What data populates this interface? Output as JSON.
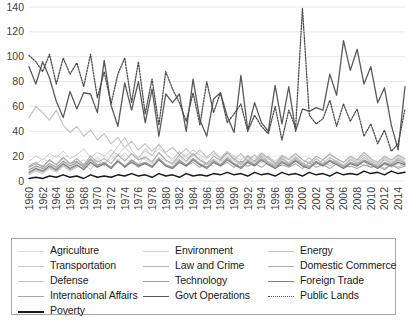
{
  "chart_data": {
    "type": "line",
    "title": "",
    "subtitle": "",
    "xlabel": "",
    "ylabel": "",
    "xlim": [
      1960,
      2015
    ],
    "ylim": [
      0,
      140
    ],
    "grid": true,
    "grid_axis": "y",
    "legend_position": "bottom",
    "y_ticks": [
      0,
      20,
      40,
      60,
      80,
      100,
      120,
      140
    ],
    "x_ticks": [
      "1960",
      "1962",
      "1964",
      "1966",
      "1968",
      "1970",
      "1972",
      "1974",
      "1976",
      "1978",
      "1980",
      "1982",
      "1984",
      "1986",
      "1988",
      "1990",
      "1992",
      "1994",
      "1996",
      "1998",
      "2000",
      "2002",
      "2004",
      "2006",
      "2008",
      "2010",
      "2012",
      "2014"
    ],
    "x": [
      1960,
      1961,
      1962,
      1963,
      1964,
      1965,
      1966,
      1967,
      1968,
      1969,
      1970,
      1971,
      1972,
      1973,
      1974,
      1975,
      1976,
      1977,
      1978,
      1979,
      1980,
      1981,
      1982,
      1983,
      1984,
      1985,
      1986,
      1987,
      1988,
      1989,
      1990,
      1991,
      1992,
      1993,
      1994,
      1995,
      1996,
      1997,
      1998,
      1999,
      2000,
      2001,
      2002,
      2003,
      2004,
      2005,
      2006,
      2007,
      2008,
      2009,
      2010,
      2011,
      2012,
      2013,
      2014,
      2015
    ],
    "series": [
      {
        "name": "Agriculture",
        "color": "#d9d9d9",
        "dash": "solid",
        "width": 1,
        "values": [
          14,
          13,
          18,
          15,
          21,
          17,
          13,
          16,
          12,
          15,
          19,
          14,
          17,
          22,
          18,
          15,
          20,
          17,
          14,
          19,
          16,
          13,
          18,
          21,
          15,
          19,
          14,
          12,
          17,
          15,
          20,
          14,
          11,
          16,
          13,
          18,
          15,
          12,
          14,
          16,
          13,
          11,
          15,
          12,
          14,
          17,
          13,
          11,
          15,
          12,
          14,
          10,
          13,
          11,
          14,
          12
        ]
      },
      {
        "name": "Transportation",
        "color": "#cccccc",
        "dash": "solid",
        "width": 1,
        "values": [
          16,
          20,
          17,
          22,
          19,
          24,
          18,
          21,
          26,
          19,
          23,
          20,
          25,
          21,
          27,
          22,
          19,
          24,
          21,
          26,
          22,
          18,
          23,
          20,
          25,
          21,
          18,
          22,
          19,
          24,
          20,
          17,
          21,
          18,
          23,
          19,
          16,
          21,
          18,
          22,
          17,
          15,
          20,
          17,
          21,
          18,
          15,
          19,
          16,
          21,
          17,
          14,
          19,
          16,
          20,
          17
        ]
      },
      {
        "name": "Defense",
        "color": "#bfbfbf",
        "dash": "solid",
        "width": 1.1,
        "values": [
          51,
          60,
          55,
          49,
          57,
          45,
          39,
          44,
          36,
          41,
          33,
          38,
          30,
          35,
          27,
          32,
          25,
          30,
          24,
          29,
          23,
          27,
          21,
          26,
          20,
          25,
          19,
          24,
          18,
          23,
          17,
          22,
          16,
          21,
          15,
          20,
          14,
          19,
          13,
          18,
          14,
          19,
          13,
          17,
          12,
          16,
          11,
          15,
          12,
          16,
          11,
          14,
          10,
          13,
          11,
          14
        ]
      },
      {
        "name": "International Affairs",
        "color": "#a6a6a6",
        "dash": "solid",
        "width": 1.1,
        "values": [
          12,
          15,
          11,
          17,
          13,
          19,
          14,
          16,
          12,
          18,
          13,
          15,
          11,
          17,
          12,
          16,
          11,
          15,
          12,
          17,
          13,
          11,
          16,
          12,
          15,
          11,
          14,
          17,
          12,
          15,
          11,
          16,
          12,
          14,
          11,
          15,
          10,
          13,
          11,
          14,
          10,
          15,
          11,
          13,
          10,
          14,
          11,
          12,
          10,
          13,
          11,
          12,
          9,
          13,
          10,
          12
        ]
      },
      {
        "name": "Poverty",
        "color": "#1a1a1a",
        "dash": "solid",
        "width": 1.4,
        "values": [
          2,
          3,
          2,
          4,
          3,
          5,
          3,
          4,
          2,
          5,
          3,
          4,
          3,
          5,
          4,
          6,
          4,
          5,
          3,
          6,
          4,
          5,
          3,
          6,
          4,
          5,
          4,
          6,
          5,
          7,
          5,
          6,
          4,
          7,
          5,
          6,
          4,
          7,
          5,
          6,
          4,
          7,
          5,
          6,
          4,
          7,
          5,
          6,
          5,
          8,
          6,
          7,
          5,
          8,
          6,
          7
        ]
      },
      {
        "name": "Environment",
        "color": "#d2d2d2",
        "dash": "solid",
        "width": 1,
        "values": [
          8,
          11,
          9,
          13,
          10,
          15,
          11,
          14,
          17,
          12,
          19,
          14,
          21,
          16,
          23,
          17,
          14,
          20,
          16,
          22,
          17,
          13,
          19,
          15,
          21,
          16,
          13,
          18,
          15,
          20,
          16,
          12,
          18,
          14,
          19,
          15,
          12,
          17,
          14,
          18,
          13,
          11,
          16,
          13,
          17,
          14,
          11,
          15,
          13,
          17,
          14,
          11,
          15,
          12,
          16,
          13
        ]
      },
      {
        "name": "Law and Crime",
        "color": "#b3b3b3",
        "dash": "solid",
        "width": 1.1,
        "values": [
          6,
          9,
          7,
          11,
          8,
          13,
          9,
          12,
          10,
          15,
          11,
          14,
          10,
          16,
          12,
          17,
          13,
          15,
          11,
          18,
          13,
          10,
          16,
          12,
          18,
          13,
          11,
          17,
          13,
          19,
          14,
          11,
          17,
          13,
          20,
          15,
          12,
          18,
          14,
          19,
          14,
          12,
          18,
          14,
          19,
          15,
          12,
          17,
          14,
          19,
          15,
          12,
          17,
          14,
          18,
          15
        ]
      },
      {
        "name": "Technology",
        "color": "#9c9c9c",
        "dash": "solid",
        "width": 1.1,
        "values": [
          9,
          12,
          10,
          14,
          11,
          16,
          12,
          15,
          11,
          17,
          12,
          15,
          11,
          16,
          12,
          17,
          13,
          15,
          12,
          18,
          13,
          11,
          17,
          13,
          18,
          14,
          11,
          16,
          13,
          18,
          14,
          11,
          16,
          13,
          18,
          14,
          11,
          16,
          13,
          17,
          13,
          11,
          16,
          13,
          17,
          14,
          11,
          15,
          13,
          17,
          14,
          11,
          15,
          13,
          17,
          14
        ]
      },
      {
        "name": "Govt Operations",
        "color": "#595959",
        "dash": "solid",
        "width": 1.3,
        "values": [
          92,
          78,
          96,
          83,
          64,
          51,
          72,
          58,
          71,
          70,
          55,
          97,
          61,
          44,
          79,
          57,
          80,
          47,
          74,
          36,
          70,
          63,
          70,
          40,
          82,
          49,
          36,
          66,
          71,
          52,
          39,
          85,
          41,
          63,
          47,
          40,
          77,
          46,
          76,
          40,
          58,
          56,
          59,
          57,
          86,
          69,
          113,
          89,
          106,
          78,
          92,
          63,
          75,
          45,
          25,
          76
        ]
      },
      {
        "name": "Energy",
        "color": "#c4c4c4",
        "dash": "solid",
        "width": 1,
        "values": [
          5,
          8,
          6,
          10,
          7,
          12,
          8,
          11,
          14,
          9,
          17,
          12,
          20,
          28,
          35,
          25,
          18,
          26,
          20,
          30,
          22,
          16,
          24,
          18,
          22,
          17,
          13,
          20,
          16,
          22,
          17,
          13,
          19,
          15,
          21,
          16,
          13,
          19,
          15,
          20,
          15,
          12,
          18,
          14,
          19,
          16,
          13,
          18,
          15,
          21,
          16,
          13,
          18,
          15,
          19,
          16
        ]
      },
      {
        "name": "Domestic Commerce",
        "color": "#adadad",
        "dash": "solid",
        "width": 1.1,
        "values": [
          11,
          14,
          12,
          17,
          13,
          19,
          14,
          18,
          13,
          20,
          15,
          18,
          14,
          21,
          16,
          22,
          17,
          19,
          15,
          23,
          17,
          14,
          21,
          16,
          22,
          17,
          14,
          20,
          17,
          23,
          18,
          14,
          20,
          16,
          22,
          18,
          14,
          20,
          17,
          22,
          17,
          14,
          20,
          17,
          22,
          18,
          15,
          20,
          17,
          23,
          18,
          15,
          20,
          17,
          21,
          18
        ]
      },
      {
        "name": "Foreign Trade",
        "color": "#7f7f7f",
        "dash": "solid",
        "width": 1.2,
        "values": [
          7,
          10,
          8,
          12,
          9,
          14,
          10,
          13,
          9,
          15,
          11,
          14,
          10,
          16,
          11,
          15,
          12,
          14,
          11,
          17,
          12,
          10,
          15,
          12,
          17,
          13,
          10,
          15,
          12,
          17,
          13,
          10,
          15,
          12,
          17,
          13,
          10,
          15,
          12,
          16,
          12,
          10,
          15,
          12,
          16,
          13,
          10,
          14,
          12,
          16,
          13,
          10,
          14,
          12,
          15,
          13
        ]
      },
      {
        "name": "Public Lands",
        "color": "#4d4d4d",
        "dash": "dotted",
        "width": 1.3,
        "values": [
          101,
          96,
          88,
          102,
          78,
          99,
          86,
          95,
          76,
          102,
          67,
          88,
          62,
          86,
          99,
          63,
          96,
          54,
          82,
          45,
          88,
          74,
          63,
          48,
          71,
          45,
          80,
          55,
          71,
          47,
          54,
          62,
          40,
          53,
          44,
          38,
          60,
          33,
          57,
          43,
          139,
          53,
          46,
          50,
          65,
          44,
          62,
          48,
          58,
          36,
          46,
          30,
          41,
          24,
          30,
          58
        ]
      }
    ],
    "legend_entries": [
      {
        "name": "Agriculture",
        "color": "#d9d9d9",
        "dash": "solid",
        "width": 1.5
      },
      {
        "name": "Environment",
        "color": "#d2d2d2",
        "dash": "solid",
        "width": 1.5
      },
      {
        "name": "Energy",
        "color": "#c4c4c4",
        "dash": "solid",
        "width": 1.5
      },
      {
        "name": "Transportation",
        "color": "#cccccc",
        "dash": "solid",
        "width": 1.5
      },
      {
        "name": "Law and Crime",
        "color": "#b3b3b3",
        "dash": "solid",
        "width": 1.5
      },
      {
        "name": "Domestic Commerce",
        "color": "#adadad",
        "dash": "solid",
        "width": 1.5
      },
      {
        "name": "Defense",
        "color": "#bfbfbf",
        "dash": "solid",
        "width": 1.5
      },
      {
        "name": "Technology",
        "color": "#9c9c9c",
        "dash": "solid",
        "width": 1.5
      },
      {
        "name": "Foreign Trade",
        "color": "#7f7f7f",
        "dash": "solid",
        "width": 1.5
      },
      {
        "name": "International Affairs",
        "color": "#a6a6a6",
        "dash": "solid",
        "width": 1.5
      },
      {
        "name": "Govt Operations",
        "color": "#595959",
        "dash": "solid",
        "width": 1.8
      },
      {
        "name": "Public Lands",
        "color": "#4d4d4d",
        "dash": "dotted",
        "width": 1.6
      },
      {
        "name": "Poverty",
        "color": "#1a1a1a",
        "dash": "solid",
        "width": 2.0
      }
    ]
  },
  "style": {
    "grid_color": "#e8e8e8",
    "axis_text_color": "#404040",
    "legend_border_color": "#a6a6a6",
    "background": "#ffffff"
  }
}
